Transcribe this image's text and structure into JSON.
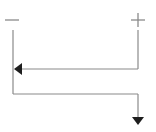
{
  "diagram": {
    "terminals": {
      "negative": {
        "symbol": "minus",
        "x": 12,
        "y": 20
      },
      "positive": {
        "symbol": "plus",
        "x": 138,
        "y": 20
      }
    },
    "paths": {
      "incoming": {
        "from": "positive",
        "to": "negative",
        "direction": "left"
      },
      "outgoing": {
        "from": "negative",
        "direction": "down"
      }
    },
    "colors": {
      "line": "#8a8a8a",
      "arrow": "#1e1e1e",
      "background": "#ffffff"
    }
  }
}
